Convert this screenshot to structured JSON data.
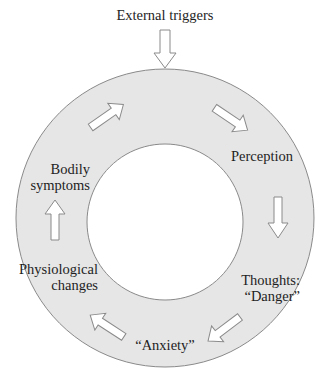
{
  "diagram": {
    "title_input": "External triggers",
    "nodes": [
      {
        "id": "perception",
        "label": "Perception"
      },
      {
        "id": "thoughts",
        "line1": "Thoughts:",
        "line2": "“Danger”"
      },
      {
        "id": "anxiety",
        "label": "“Anxiety”"
      },
      {
        "id": "physiological",
        "line1": "Physiological",
        "line2": "changes"
      },
      {
        "id": "bodily",
        "line1": "Bodily",
        "line2": "symptoms"
      }
    ],
    "cycle_order": [
      "Perception",
      "Thoughts: “Danger”",
      "“Anxiety”",
      "Physiological changes",
      "Bodily symptoms",
      "Perception"
    ],
    "colors": {
      "ring_fill": "#e6e6e6",
      "ring_stroke": "#8a8a8a",
      "arrow_fill": "#ffffff",
      "arrow_stroke": "#8a8a8a",
      "text": "#1e1e1e"
    }
  }
}
